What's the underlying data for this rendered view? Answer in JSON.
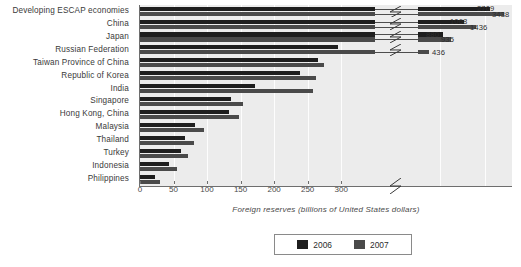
{
  "chart_data": {
    "type": "bar",
    "orientation": "horizontal",
    "title": "",
    "xlabel": "Foreign reserves (billions of United States dollars)",
    "ylabel": "",
    "xlim": [
      0,
      320
    ],
    "xticks": [
      0,
      50,
      100,
      150,
      200,
      250,
      300
    ],
    "grid": true,
    "axis_break": true,
    "legend_position": "bottom",
    "categories": [
      "Developing ESCAP economies",
      "China",
      "Japan",
      "Russian Federation",
      "Taiwan Province of China",
      "Republic of Korea",
      "India",
      "Singapore",
      "Hong Kong, China",
      "Malaysia",
      "Thailand",
      "Turkey",
      "Indonesia",
      "Philippines"
    ],
    "series": [
      {
        "name": "2006",
        "color": "#1e1e1e",
        "values": [
          2709,
          1068,
          880,
          296,
          266,
          239,
          171,
          136,
          133,
          82,
          67,
          61,
          43,
          23
        ]
      },
      {
        "name": "2007",
        "color": "#4a4a4a",
        "values": [
          3438,
          1436,
          935,
          436,
          275,
          262,
          258,
          153,
          148,
          95,
          80,
          72,
          55,
          30
        ]
      }
    ],
    "value_labels": [
      {
        "category": "Developing ESCAP economies",
        "series": "2006",
        "text": "2709"
      },
      {
        "category": "Developing ESCAP economies",
        "series": "2007",
        "text": "3438"
      },
      {
        "category": "China",
        "series": "2006",
        "text": "1068"
      },
      {
        "category": "China",
        "series": "2007",
        "text": "1436"
      },
      {
        "category": "Japan",
        "series": "2006",
        "text": "880"
      },
      {
        "category": "Japan",
        "series": "2007",
        "text": "935"
      },
      {
        "category": "Russian Federation",
        "series": "2007",
        "text": "436"
      }
    ]
  },
  "legend": {
    "items": [
      {
        "label": "2006",
        "color": "#1e1e1e"
      },
      {
        "label": "2007",
        "color": "#4a4a4a"
      }
    ]
  },
  "axis": {
    "x_title": "Foreign reserves (billions of United States dollars)",
    "tick_labels": [
      "0",
      "50",
      "100",
      "150",
      "200",
      "250",
      "300"
    ]
  },
  "colors": {
    "plot_background": "#ececec",
    "gridline": "#fdfdfd",
    "axis": "#6e6e6e",
    "series_2006": "#1e1e1e",
    "series_2007": "#4a4a4a",
    "page_background": "#ffffff"
  }
}
